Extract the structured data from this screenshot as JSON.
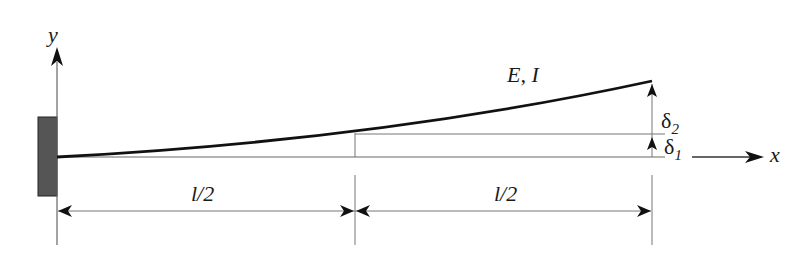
{
  "diagram": {
    "type": "cantilever-beam-deflection",
    "labels": {
      "y_axis": "y",
      "x_axis": "x",
      "properties": "E, I",
      "left_span": "l/2",
      "right_span": "l/2",
      "delta1_symbol": "δ",
      "delta1_sub": "1",
      "delta2_symbol": "δ",
      "delta2_sub": "2"
    },
    "colors": {
      "wall_fill": "#555555",
      "beam": "#111111",
      "lines": "#777777",
      "arrows": "#111111"
    },
    "geometry": {
      "support": "fixed-wall",
      "beam_start": [
        57,
        157
      ],
      "beam_mid": [
        355,
        133
      ],
      "beam_end": [
        652,
        81
      ]
    }
  }
}
